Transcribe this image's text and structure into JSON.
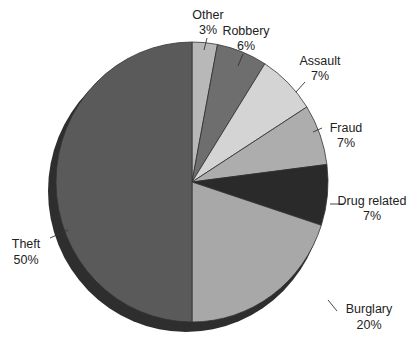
{
  "chart_data": {
    "type": "pie",
    "title": "",
    "start_angle": "12 o'clock",
    "direction": "clockwise",
    "categories": [
      "Other",
      "Robbery",
      "Assault",
      "Fraud",
      "Drug related",
      "Burglary",
      "Theft"
    ],
    "values": [
      3,
      6,
      7,
      7,
      7,
      20,
      50
    ],
    "value_labels": [
      "3%",
      "6%",
      "7%",
      "7%",
      "7%",
      "20%",
      "50%"
    ],
    "colors": [
      "#b8b8b8",
      "#6e6e6e",
      "#d4d4d4",
      "#adadad",
      "#2a2a2a",
      "#a8a8a8",
      "#5a5a5a"
    ],
    "style": "3D pie with dark side edge, leader lines to labels",
    "legend": "none (direct labels)"
  },
  "labels": [
    {
      "name": "Other",
      "pct": "3%"
    },
    {
      "name": "Robbery",
      "pct": "6%"
    },
    {
      "name": "Assault",
      "pct": "7%"
    },
    {
      "name": "Fraud",
      "pct": "7%"
    },
    {
      "name": "Drug related",
      "pct": "7%"
    },
    {
      "name": "Burglary",
      "pct": "20%"
    },
    {
      "name": "Theft",
      "pct": "50%"
    }
  ]
}
